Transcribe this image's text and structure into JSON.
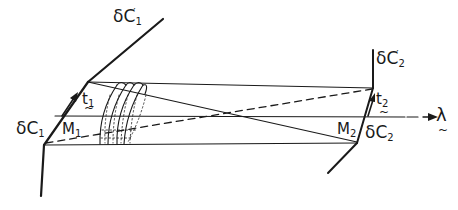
{
  "diagram": {
    "title": "",
    "labels": {
      "dC1_prime": {
        "base": "δC",
        "sub": "1",
        "prime": "′"
      },
      "dC2_prime": {
        "base": "δC",
        "sub": "2",
        "prime": "′"
      },
      "dC1": {
        "base": "δC",
        "sub": "1"
      },
      "dC2": {
        "base": "δC",
        "sub": "2"
      },
      "M1": {
        "base": "M",
        "sub": "1"
      },
      "M2": {
        "base": "M",
        "sub": "2"
      },
      "t1": {
        "base": "t",
        "sub": "1",
        "tilde": "~"
      },
      "t2": {
        "base": "t",
        "sub": "2",
        "tilde": "~"
      },
      "lambda": {
        "base": "λ",
        "tilde": "~"
      }
    },
    "colors": {
      "ink": "#1a1a1a",
      "background": "#ffffff"
    },
    "elements": [
      "surface-dC1-prime (upper-left oblique line)",
      "surface-dC1 (lower-left vertical line)",
      "mirror-M1 (left oblique segment)",
      "surface-dC2-prime (upper-right vertical line)",
      "surface-dC2 (lower-right oblique line)",
      "mirror-M2 (right oblique segment)",
      "top-horizontal-line",
      "bottom-horizontal-line",
      "lambda-axis-arrow",
      "crossing-solid-diagonal",
      "crossing-dashed-diagonal",
      "wavefront-arcs (3 curved lines with dotted guides)",
      "t1-arrow",
      "t2-arrow"
    ]
  }
}
